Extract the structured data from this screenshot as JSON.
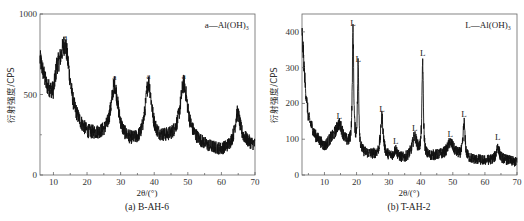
{
  "chart_data": [
    {
      "type": "line",
      "panel": "a",
      "caption": "(a) B-AH-6",
      "title": "",
      "xlabel": "2θ/(°)",
      "ylabel": "衍射强度/CPS",
      "xlim": [
        6,
        70
      ],
      "ylim": [
        0,
        1000
      ],
      "xticks": [
        10,
        20,
        30,
        40,
        50,
        60,
        70
      ],
      "yticks": [
        0,
        500,
        1000
      ],
      "grid": false,
      "legend": {
        "text": "a—Al(OH)₃",
        "position": "top-right"
      },
      "peak_marker": "a",
      "baseline": [
        [
          6,
          700
        ],
        [
          8,
          520
        ],
        [
          10,
          450
        ],
        [
          11,
          560
        ],
        [
          16,
          320
        ],
        [
          20,
          240
        ],
        [
          25,
          230
        ],
        [
          33,
          190
        ],
        [
          36,
          180
        ],
        [
          43,
          210
        ],
        [
          50,
          230
        ],
        [
          56,
          170
        ],
        [
          60,
          150
        ],
        [
          63,
          170
        ],
        [
          67,
          200
        ],
        [
          70,
          180
        ]
      ],
      "peaks": [
        {
          "x": 13.5,
          "y": 800,
          "width": 1.8,
          "label": "a"
        },
        {
          "x": 28.2,
          "y": 550,
          "width": 1.3,
          "label": "a"
        },
        {
          "x": 38.3,
          "y": 560,
          "width": 1.2,
          "label": "a"
        },
        {
          "x": 48.8,
          "y": 560,
          "width": 1.3,
          "label": "a"
        },
        {
          "x": 64.8,
          "y": 380,
          "width": 1.0,
          "label": ""
        }
      ],
      "noise": 55,
      "series": [
        {
          "name": "B-AH-6",
          "color": "#111111"
        }
      ]
    },
    {
      "type": "line",
      "panel": "b",
      "caption": "(b) T-AH-2",
      "title": "",
      "xlabel": "2θ/(°)",
      "ylabel": "衍射强度/CPS",
      "xlim": [
        3,
        70
      ],
      "ylim": [
        0,
        450
      ],
      "xticks": [
        10,
        20,
        30,
        40,
        50,
        60,
        70
      ],
      "yticks": [
        0,
        100,
        200,
        300,
        400
      ],
      "grid": false,
      "legend": {
        "text": "L—Al(OH)₃",
        "position": "top-right"
      },
      "peak_marker": "L",
      "baseline": [
        [
          3,
          400
        ],
        [
          4,
          250
        ],
        [
          5,
          160
        ],
        [
          7,
          110
        ],
        [
          10,
          75
        ],
        [
          12,
          90
        ],
        [
          17,
          75
        ],
        [
          19,
          70
        ],
        [
          21,
          60
        ],
        [
          25,
          55
        ],
        [
          30,
          50
        ],
        [
          35,
          45
        ],
        [
          38,
          60
        ],
        [
          42,
          50
        ],
        [
          46,
          55
        ],
        [
          50,
          60
        ],
        [
          55,
          45
        ],
        [
          60,
          40
        ],
        [
          65,
          45
        ],
        [
          70,
          35
        ]
      ],
      "peaks": [
        {
          "x": 14.6,
          "y": 140,
          "width": 1.5,
          "label": "L"
        },
        {
          "x": 18.9,
          "y": 400,
          "width": 0.25,
          "label": "L"
        },
        {
          "x": 20.5,
          "y": 300,
          "width": 0.25,
          "label": "L"
        },
        {
          "x": 27.9,
          "y": 160,
          "width": 0.5,
          "label": "L"
        },
        {
          "x": 32.2,
          "y": 70,
          "width": 0.5,
          "label": "L"
        },
        {
          "x": 38.1,
          "y": 105,
          "width": 0.8,
          "label": "L"
        },
        {
          "x": 40.6,
          "y": 315,
          "width": 0.25,
          "label": "L"
        },
        {
          "x": 49.2,
          "y": 90,
          "width": 1.0,
          "label": "L"
        },
        {
          "x": 53.5,
          "y": 145,
          "width": 0.35,
          "label": "L"
        },
        {
          "x": 64.0,
          "y": 80,
          "width": 0.5,
          "label": "L"
        }
      ],
      "noise": 22,
      "series": [
        {
          "name": "T-AH-2",
          "color": "#111111"
        }
      ]
    }
  ],
  "panels": {
    "a": {
      "caption": "(a) B-AH-6",
      "xlabel": "2θ/(°)",
      "ylabel": "衍射强度/CPS",
      "legend": "a—Al(OH)₃"
    },
    "b": {
      "caption": "(b) T-AH-2",
      "xlabel": "2θ/(°)",
      "ylabel": "衍射强度/CPS",
      "legend": "L—Al(OH)₃"
    }
  }
}
